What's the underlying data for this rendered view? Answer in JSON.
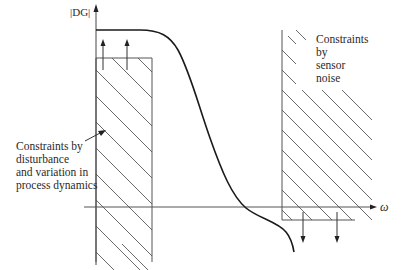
{
  "diagram": {
    "type": "loop-shaping constraints sketch",
    "y_axis_label": "|DG|",
    "x_axis_label": "ω",
    "curve": {
      "name": "open-loop gain |DG|",
      "description": "flat at high gain for low frequency, rolls off, crosses ω-axis, continues downward"
    },
    "regions": [
      {
        "name": "low-frequency constraint",
        "label_lines": [
          "Constraints by",
          "disturbance",
          "and variation in",
          "process dynamics"
        ],
        "arrow_direction": "up",
        "hatched": true
      },
      {
        "name": "high-frequency constraint",
        "label_lines": [
          "Constraints",
          "by",
          "sensor",
          "noise"
        ],
        "arrow_direction": "down",
        "hatched": true
      }
    ],
    "colors": {
      "line": "#333333",
      "curve": "#1a1a1a",
      "background": "#ffffff"
    }
  }
}
